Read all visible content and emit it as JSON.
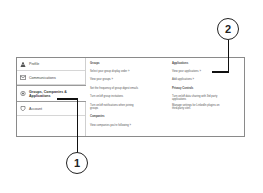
{
  "sidebar": {
    "items": [
      {
        "label": "Profile",
        "icon": "person-icon",
        "active": false
      },
      {
        "label": "Communications",
        "icon": "envelope-icon",
        "active": false
      },
      {
        "label": "Groups, Companies &",
        "label2": "Applications",
        "icon": "groups-icon",
        "active": true
      },
      {
        "label": "Account",
        "icon": "shield-icon",
        "active": false
      }
    ]
  },
  "groups_column": {
    "heading": "Groups",
    "links": [
      "Select your group display order »",
      "View your groups »",
      "Set the frequency of group digest emails",
      "Turn on/off group invitations",
      "Turn on/off notifications when joining",
      "groups"
    ],
    "companies_heading": "Companies",
    "companies_link": "View companies you're following »"
  },
  "applications_column": {
    "heading": "Applications",
    "links": [
      "View your applications »",
      "Add applications »"
    ],
    "privacy_heading": "Privacy Controls",
    "privacy_links": [
      "Turn on/off data sharing with 3rd party",
      "applications",
      "Manage settings for LinkedIn plugins on",
      "third-party sites"
    ]
  },
  "callouts": [
    {
      "number": "1"
    },
    {
      "number": "2"
    }
  ]
}
